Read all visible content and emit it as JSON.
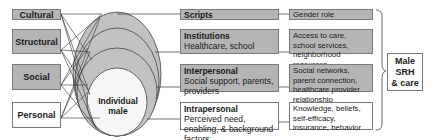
{
  "levels": [
    {
      "label": "Cultural",
      "fill": "gray"
    },
    {
      "label": "Structural",
      "fill": "gray"
    },
    {
      "label": "Social",
      "fill": "gray"
    },
    {
      "label": "Personal",
      "fill": "white"
    }
  ],
  "center": {
    "label_line1": "Individual",
    "label_line2": "male"
  },
  "domains": [
    {
      "title": "Scripts",
      "detail": ""
    },
    {
      "title": "Institutions",
      "detail": "Healthcare, school"
    },
    {
      "title": "Interpersonal",
      "detail": "Social support, parents, providers"
    },
    {
      "title": "Intrapersonal",
      "detail": "Perceived need, enabling, & background factors"
    }
  ],
  "factors": [
    "Gender role",
    "Access to care, school services, neighborhood resources",
    "Social networks, parent connection, healthcare provider relationship",
    "Knowledge, beliefs, self-efficacy, insurance, behavior"
  ],
  "outcome": {
    "line1": "Male",
    "line2": "SRH",
    "line3": "& care"
  },
  "colors": {
    "gray_fill": "#b5b5b5",
    "ellipse_fill": "#c4c4c4",
    "border": "#7a7a7a",
    "line": "#333333"
  }
}
